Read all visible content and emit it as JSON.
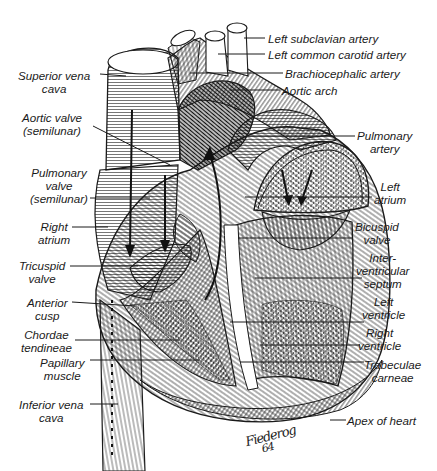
{
  "diagram": {
    "style": "pen-and-ink line illustration",
    "signature": {
      "name": "Fiederog",
      "year": "64"
    }
  },
  "labels": {
    "left_subclavian_artery": "Left subclavian artery",
    "left_common_carotid_artery": "Left common carotid artery",
    "brachiocephalic_artery": "Brachiocephalic artery",
    "aortic_arch": "Aortic arch",
    "superior_vena_cava": [
      "Superior vena",
      "cava"
    ],
    "aortic_valve": [
      "Aortic valve",
      "(semilunar)"
    ],
    "pulmonary_artery": [
      "Pulmonary",
      "artery"
    ],
    "pulmonary_valve": [
      "Pulmonary",
      "valve",
      "(semilunar)"
    ],
    "left_atrium": [
      "Left",
      "atrium"
    ],
    "right_atrium": [
      "Right",
      "atrium"
    ],
    "bicuspid_valve": [
      "Bicuspid",
      "valve"
    ],
    "tricuspid_valve": [
      "Tricuspid",
      "valve"
    ],
    "interventricular_septum": [
      "Inter-",
      "ventricular",
      "septum"
    ],
    "anterior_cusp": [
      "Anterior",
      "cusp"
    ],
    "left_ventricle": [
      "Left",
      "ventricle"
    ],
    "chordae_tendineae": [
      "Chordae",
      "tendineae"
    ],
    "right_ventricle": [
      "Right",
      "ventricle"
    ],
    "papillary_muscle": [
      "Papillary",
      "muscle"
    ],
    "trabeculae_carneae": [
      "Trabeculae",
      "carneae"
    ],
    "inferior_vena_cava": [
      "Inferior vena",
      "cava"
    ],
    "apex_of_heart": "Apex of heart"
  },
  "colors": {
    "ink": "#1a1a1a",
    "paper": "#ffffff"
  }
}
